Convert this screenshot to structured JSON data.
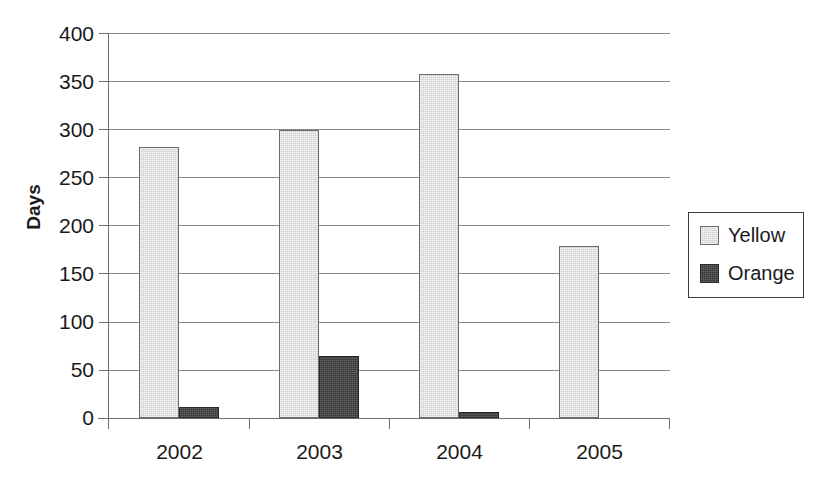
{
  "chart_data": {
    "type": "bar",
    "title": "",
    "subtitle": "",
    "xlabel": "",
    "ylabel": "Days",
    "categories": [
      "2002",
      "2003",
      "2004",
      "2005"
    ],
    "series": [
      {
        "name": "Yellow",
        "color": "#cdcdcd",
        "values": [
          282,
          299,
          357,
          179
        ]
      },
      {
        "name": "Orange",
        "color": "#333333",
        "values": [
          11,
          64,
          6,
          0
        ]
      }
    ],
    "ylim": [
      0,
      400
    ],
    "ytick_step": 50,
    "yticks": [
      "400",
      "350",
      "300",
      "250",
      "200",
      "150",
      "100",
      "50",
      "0"
    ],
    "grid": "horizontal",
    "legend_position": "right",
    "legend_entries": [
      "Yellow",
      "Orange"
    ],
    "annotations": []
  }
}
